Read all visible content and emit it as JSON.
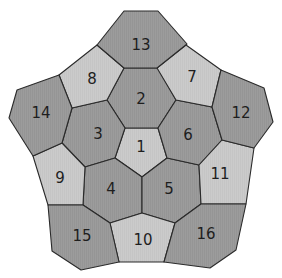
{
  "diagram": {
    "type": "polygon-tiling",
    "colors": {
      "dark_fill": "#9c9c9c",
      "light_fill": "#c9c9c9",
      "stroke": "#2a2a2a",
      "label": "#1e1e1e"
    },
    "cells": [
      {
        "id": "1",
        "label": "1",
        "shade": "light",
        "label_pos": [
          141,
          147
        ],
        "points": "125,128 158,128 167,158 142,177 115,158"
      },
      {
        "id": "2",
        "label": "2",
        "shade": "dark",
        "label_pos": [
          141,
          99
        ],
        "points": "124,68 158,68 176,100 158,128 125,128 107,100"
      },
      {
        "id": "3",
        "label": "3",
        "shade": "dark",
        "label_pos": [
          98,
          134
        ],
        "points": "72,108 107,100 125,128 115,158 85,167 62,143"
      },
      {
        "id": "4",
        "label": "4",
        "shade": "dark",
        "label_pos": [
          111,
          189
        ],
        "points": "85,167 115,158 142,177 142,213 110,223 83,205"
      },
      {
        "id": "5",
        "label": "5",
        "shade": "dark",
        "label_pos": [
          169,
          189
        ],
        "points": "142,177 167,158 199,165 201,204 175,223 142,213"
      },
      {
        "id": "6",
        "label": "6",
        "shade": "dark",
        "label_pos": [
          188,
          135
        ],
        "points": "176,100 212,107 222,140 199,165 167,158 158,128"
      },
      {
        "id": "7",
        "label": "7",
        "shade": "light",
        "label_pos": [
          192,
          77
        ],
        "points": "157,68 186,45 221,70 212,107 176,100"
      },
      {
        "id": "8",
        "label": "8",
        "shade": "light",
        "label_pos": [
          92,
          79
        ],
        "points": "59,75 97,45 124,68 107,100 72,108"
      },
      {
        "id": "9",
        "label": "9",
        "shade": "light",
        "label_pos": [
          60,
          178
        ],
        "points": "33,156 62,143 85,167 83,205 48,205"
      },
      {
        "id": "10",
        "label": "10",
        "shade": "light",
        "label_pos": [
          143,
          240
        ],
        "points": "110,223 142,213 175,223 164,262 119,262"
      },
      {
        "id": "11",
        "label": "11",
        "shade": "light",
        "label_pos": [
          220,
          174
        ],
        "points": "199,165 222,140 254,148 246,204 201,204"
      },
      {
        "id": "12",
        "label": "12",
        "shade": "dark",
        "label_pos": [
          241,
          113
        ],
        "points": "221,70 264,88 273,122 254,148 222,140 212,107"
      },
      {
        "id": "13",
        "label": "13",
        "shade": "dark",
        "label_pos": [
          141,
          45
        ],
        "points": "124,11 158,11 187,44 157,68 124,68 97,45"
      },
      {
        "id": "14",
        "label": "14",
        "shade": "dark",
        "label_pos": [
          41,
          113
        ],
        "points": "17,90 59,75 72,108 62,143 33,156 9,118"
      },
      {
        "id": "15",
        "label": "15",
        "shade": "dark",
        "label_pos": [
          82,
          236
        ],
        "points": "48,205 83,205 110,223 119,262 81,270 52,251"
      },
      {
        "id": "16",
        "label": "16",
        "shade": "dark",
        "label_pos": [
          206,
          234
        ],
        "points": "175,223 201,204 246,204 236,250 210,268 164,262"
      }
    ]
  }
}
